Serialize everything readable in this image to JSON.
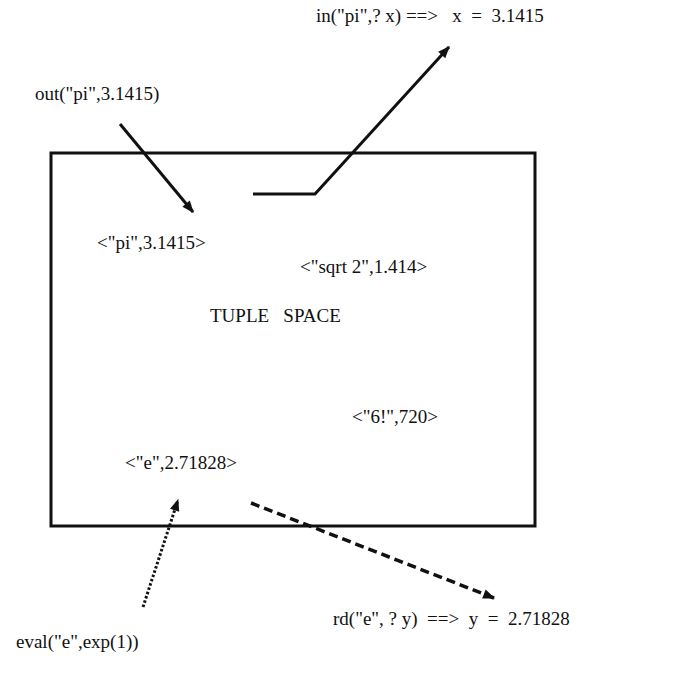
{
  "diagram": {
    "title": "TUPLE   SPACE",
    "colors": {
      "ink": "#111111",
      "background": "#ffffff"
    },
    "box": {
      "x": 51,
      "y": 153,
      "width": 484,
      "height": 373
    },
    "operations": {
      "out": "out(\"pi\",3.1415)",
      "in": "in(\"pi\",? x) ==>   x  =  3.1415",
      "eval": "eval(\"e\",exp(1))",
      "rd": "rd(\"e\", ? y)  ==>  y  =  2.71828"
    },
    "tuples": [
      {
        "id": "pi",
        "text": "<\"pi\",3.1415>"
      },
      {
        "id": "sqrt2",
        "text": "<\"sqrt 2\",1.414>"
      },
      {
        "id": "fact6",
        "text": "<\"6!\",720>"
      },
      {
        "id": "e",
        "text": "<\"e\",2.71828>"
      }
    ],
    "arrows": [
      {
        "from": "out",
        "to": "tuple-pi",
        "style": "solid"
      },
      {
        "from": "tuple-pi",
        "to": "in",
        "style": "solid-bent"
      },
      {
        "from": "eval",
        "to": "tuple-e",
        "style": "dotted"
      },
      {
        "from": "tuple-e",
        "to": "rd",
        "style": "dashed"
      }
    ]
  }
}
